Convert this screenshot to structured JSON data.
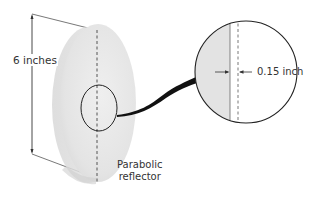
{
  "diagram": {
    "labels": {
      "height": "6 inches",
      "thickness": "0.15 inch",
      "reflector_line1": "Parabolic",
      "reflector_line2": "reflector"
    },
    "dimensions": {
      "diameter_inches": 6,
      "thickness_inch": 0.15
    },
    "colors": {
      "disc_fill": "#e6e6e6",
      "disc_shadow": "#d4d4d4",
      "outline": "#2a2a2a",
      "text": "#333333",
      "callout_strip": "#e3e3e3"
    }
  }
}
